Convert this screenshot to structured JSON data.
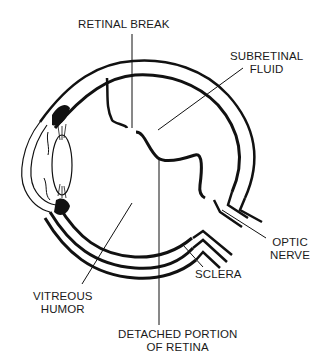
{
  "diagram": {
    "labels": {
      "retinal_break": [
        "RETINAL BREAK"
      ],
      "subretinal_fluid": [
        "SUBRETINAL",
        "FLUID"
      ],
      "optic_nerve": [
        "OPTIC",
        "NERVE"
      ],
      "sclera": [
        "SCLERA"
      ],
      "vitreous_humor": [
        "VITREOUS",
        "HUMOR"
      ],
      "detached_portion": [
        "DETACHED PORTION",
        "OF RETINA"
      ]
    },
    "colors": {
      "line": "#111111",
      "background": "#ffffff",
      "text": "#1a1a1a"
    }
  }
}
